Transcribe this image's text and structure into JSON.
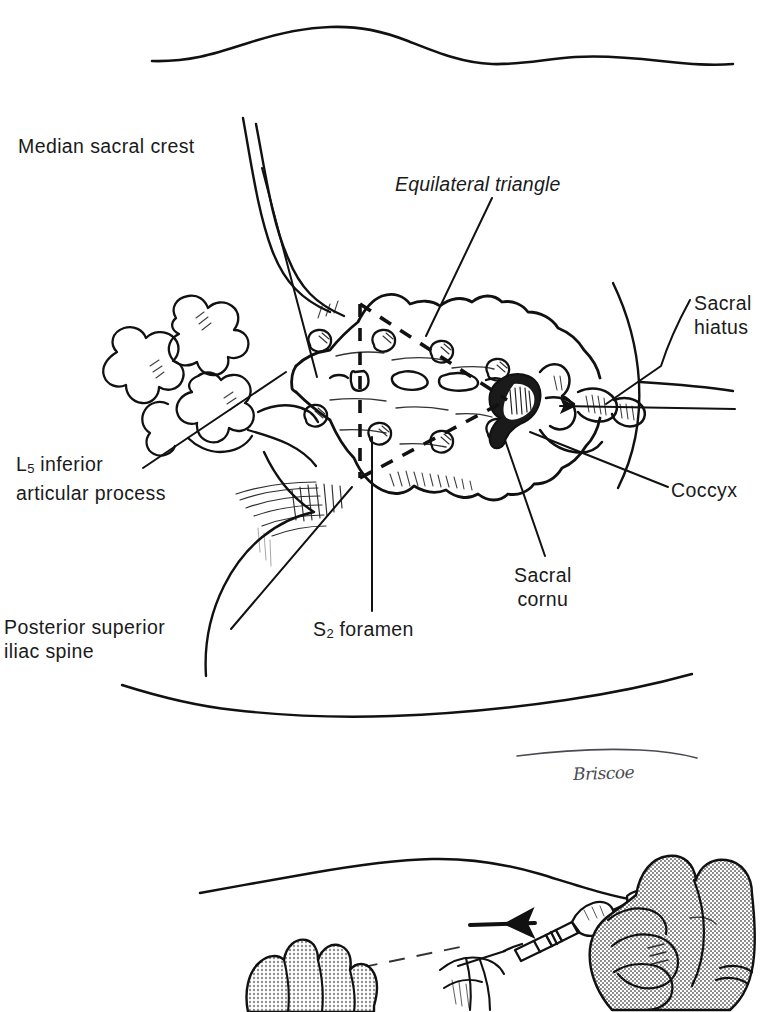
{
  "figure": {
    "panels": [
      {
        "id": "upper",
        "name": "sacral-landmarks-panel"
      },
      {
        "id": "lower",
        "name": "needle-insertion-panel"
      }
    ],
    "ink_color": "#111111",
    "background_color": "#ffffff",
    "shading_color": "#8f8f8f",
    "signature_color": "#4a4a52"
  },
  "labels": {
    "median_sacral_crest": "Median sacral crest",
    "equilateral_triangle": "Equilateral triangle",
    "sacral_hiatus_line1": "Sacral",
    "sacral_hiatus_line2": "hiatus",
    "coccyx": "Coccyx",
    "l5_line1_pre": "L",
    "l5_line1_sub": "5",
    "l5_line1_post": " inferior",
    "l5_line2": "articular process",
    "posterior_superior_line1": "Posterior superior",
    "posterior_superior_line2": "iliac spine",
    "s2_foramen_pre": "S",
    "s2_foramen_sub": "2",
    "s2_foramen_post": " foramen",
    "sacral_cornu_line1": "Sacral",
    "sacral_cornu_line2": "cornu"
  },
  "signature": {
    "artist": "Briscoe"
  },
  "annotations": {
    "needle_direction_arrow": "arrow pointing left along needle axis",
    "coccyx_pointer_arrow": "arrow pointing left to coccyx tip",
    "triangle_style": "dashed",
    "triangle_vertices": [
      "superior-left crest",
      "superior-right crest",
      "sacral hiatus apex"
    ]
  }
}
